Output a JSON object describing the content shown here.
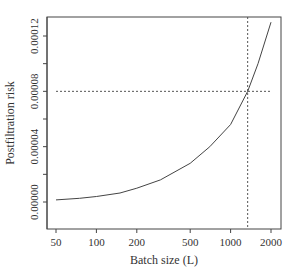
{
  "chart_data": {
    "type": "line",
    "title": "",
    "xlabel": "Batch size (L)",
    "ylabel": "Postfiltration risk",
    "xscale": "log",
    "xlim": [
      45,
      2300
    ],
    "ylim": [
      -1.5e-05,
      0.000137
    ],
    "x_ticks": [
      50,
      100,
      200,
      500,
      1000,
      2000
    ],
    "x_tick_labels": [
      "50",
      "100",
      "200",
      "500",
      "1000",
      "2000"
    ],
    "y_ticks": [
      0.0,
      2e-05,
      4e-05,
      6e-05,
      8e-05,
      0.0001,
      0.00012
    ],
    "y_tick_labels": [
      "0.00000",
      "",
      "0.00004",
      "",
      "0.00008",
      "",
      "0.00012"
    ],
    "grid": false,
    "legend": null,
    "series": [
      {
        "name": "risk curve",
        "style": "solid",
        "x": [
          50,
          75,
          100,
          150,
          200,
          300,
          500,
          700,
          1000,
          1340,
          1600,
          2000
        ],
        "y": [
          1.5e-06,
          2.7e-06,
          4e-06,
          6.5e-06,
          1e-05,
          1.6e-05,
          2.8e-05,
          4e-05,
          5.6e-05,
          8e-05,
          0.0001,
          0.00013
        ]
      }
    ],
    "annotations": [
      {
        "type": "hline",
        "style": "dashed",
        "y": 8e-05,
        "x_range": [
          50,
          2000
        ]
      },
      {
        "type": "vline",
        "style": "dashed",
        "x": 1340
      }
    ]
  }
}
